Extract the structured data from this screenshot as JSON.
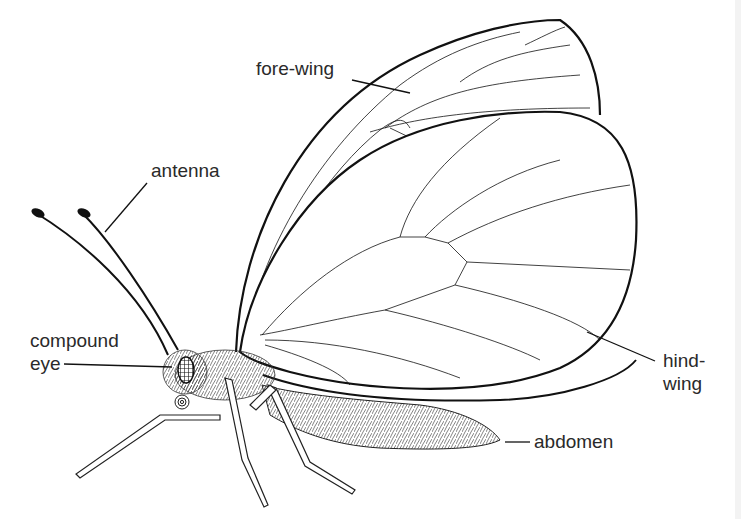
{
  "diagram": {
    "labels": {
      "fore_wing": "fore-wing",
      "antenna": "antenna",
      "compound_eye_line1": "compound",
      "compound_eye_line2": "eye",
      "hind_wing_line1": "hind-",
      "hind_wing_line2": "wing",
      "abdomen": "abdomen"
    },
    "colors": {
      "ink": "#1a1a1a",
      "background": "#ffffff"
    }
  }
}
